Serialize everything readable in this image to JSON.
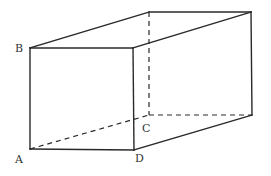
{
  "diagram": {
    "type": "rectangular-prism",
    "vertices": {
      "A": {
        "x": 30,
        "y": 149
      },
      "B": {
        "x": 30,
        "y": 48
      },
      "C": {
        "x": 149,
        "y": 115
      },
      "D": {
        "x": 134,
        "y": 150
      },
      "front_top_right": {
        "x": 133,
        "y": 48
      },
      "back_top_left": {
        "x": 149,
        "y": 12
      },
      "back_top_right": {
        "x": 251,
        "y": 12
      },
      "back_bottom_right": {
        "x": 252,
        "y": 115
      }
    },
    "labels": {
      "A": "A",
      "B": "B",
      "C": "C",
      "D": "D"
    },
    "solid_edges": [
      [
        "A",
        "B"
      ],
      [
        "B",
        "front_top_right"
      ],
      [
        "front_top_right",
        "D"
      ],
      [
        "A",
        "D"
      ],
      [
        "B",
        "back_top_left"
      ],
      [
        "back_top_left",
        "back_top_right"
      ],
      [
        "front_top_right",
        "back_top_right"
      ],
      [
        "back_top_right",
        "back_bottom_right"
      ],
      [
        "D",
        "back_bottom_right"
      ]
    ],
    "hidden_edges": [
      [
        "back_top_left",
        "C"
      ],
      [
        "C",
        "back_bottom_right"
      ],
      [
        "A",
        "C"
      ]
    ],
    "colors": {
      "line": "#2a2a2a",
      "label": "#333333",
      "background": "#ffffff"
    }
  }
}
